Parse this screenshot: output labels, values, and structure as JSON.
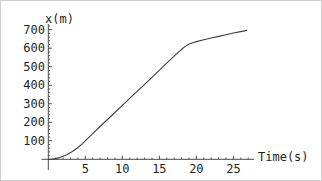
{
  "chart_data": {
    "type": "line",
    "title": "",
    "xlabel": "Time(s)",
    "ylabel": "x(m)",
    "x_ticks": [
      5,
      10,
      15,
      20,
      25
    ],
    "y_ticks": [
      100,
      200,
      300,
      400,
      500,
      600,
      700
    ],
    "x_minor_step": 1,
    "y_minor_step": 20,
    "xlim": [
      0,
      28
    ],
    "ylim": [
      0,
      760
    ],
    "grid": false,
    "legend": false,
    "colors": {
      "axis": "#4a4a4a",
      "curve": "#3f3f3f",
      "text": "#1f1f1f",
      "background": "#ffffff"
    },
    "series": [
      {
        "name": "position",
        "x": [
          0,
          0.5,
          1,
          1.5,
          2,
          2.5,
          3,
          3.5,
          4,
          4.5,
          5,
          6,
          7,
          8,
          9,
          10,
          11,
          12,
          13,
          14,
          15,
          16,
          17,
          17.5,
          18,
          18.5,
          19,
          19.5,
          20,
          21,
          22,
          23,
          24,
          25,
          26,
          26.8
        ],
        "y": [
          0,
          1,
          4,
          9,
          16,
          25,
          36,
          49,
          64,
          81,
          100,
          139,
          177,
          215,
          253,
          291,
          329,
          367,
          405,
          443,
          481,
          519,
          557,
          576,
          594,
          610,
          622,
          630,
          636,
          646,
          655,
          664,
          673,
          682,
          690,
          696
        ]
      }
    ]
  }
}
